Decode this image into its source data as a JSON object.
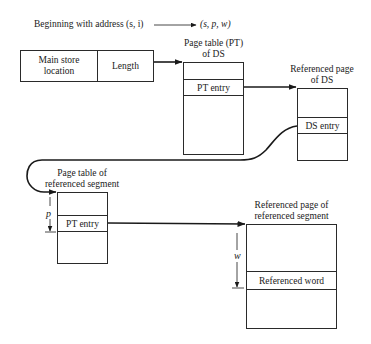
{
  "header": {
    "source_address": "Beginning with address (s, i)",
    "target_address": "(s, p, w)"
  },
  "descriptor": {
    "main_store_location": "Main store\nlocation",
    "main_store_line1": "Main store",
    "main_store_line2": "location",
    "length": "Length"
  },
  "page_table_ds": {
    "title_line1": "Page table (PT)",
    "title_line2": "of DS",
    "entry": "PT entry"
  },
  "referenced_page_ds": {
    "title_line1": "Referenced page",
    "title_line2": "of DS",
    "entry": "DS entry"
  },
  "page_table_segment": {
    "title_line1": "Page table of",
    "title_line2": "referenced segment",
    "entry": "PT entry",
    "offset_label": "p"
  },
  "referenced_page_segment": {
    "title_line1": "Referenced page of",
    "title_line2": "referenced segment",
    "entry": "Referenced word",
    "offset_label": "w"
  },
  "colors": {
    "line": "#1a1a1a",
    "background": "#ffffff"
  }
}
